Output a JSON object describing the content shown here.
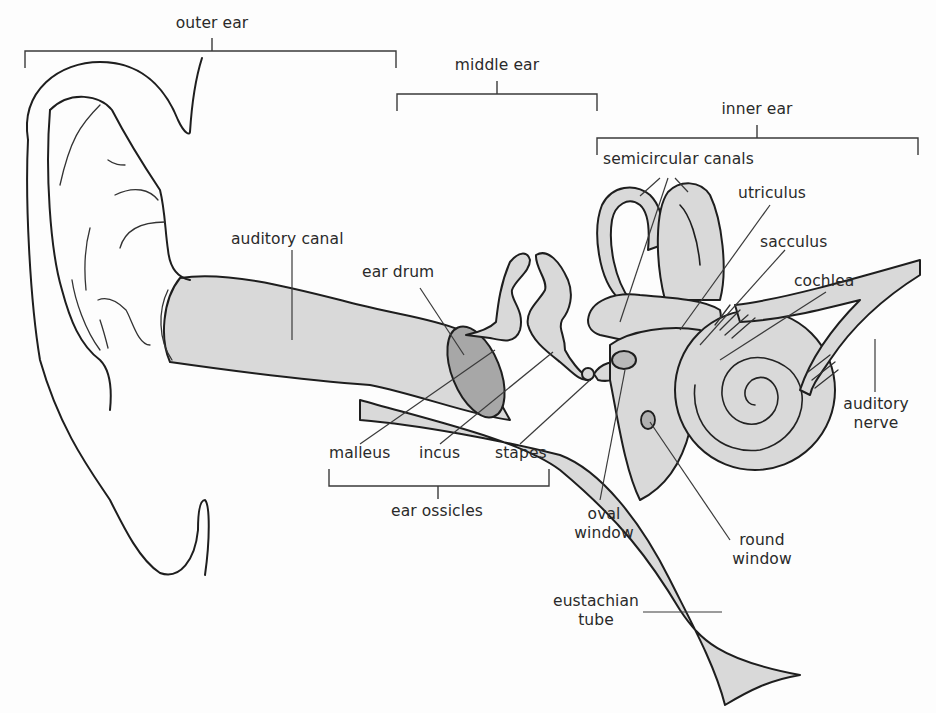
{
  "diagram": {
    "colors": {
      "background": "#fdfdfd",
      "outline": "#1e1e1e",
      "tissue_fill": "#d9d9d9",
      "ear_drum_fill": "#a7a7a7",
      "label_text": "#2a2a2a"
    },
    "regions": {
      "outer_ear": "outer ear",
      "middle_ear": "middle ear",
      "inner_ear": "inner ear"
    },
    "labels": {
      "auditory_canal": "auditory canal",
      "ear_drum": "ear drum",
      "semicircular_canals": "semicircular canals",
      "utriculus": "utriculus",
      "sacculus": "sacculus",
      "cochlea": "cochlea",
      "auditory_nerve_line1": "auditory",
      "auditory_nerve_line2": "nerve",
      "malleus": "malleus",
      "incus": "incus",
      "stapes": "stapes",
      "ear_ossicles": "ear ossicles",
      "oval_window_line1": "oval",
      "oval_window_line2": "window",
      "round_window_line1": "round",
      "round_window_line2": "window",
      "eustachian_tube_line1": "eustachian",
      "eustachian_tube_line2": "tube"
    }
  }
}
